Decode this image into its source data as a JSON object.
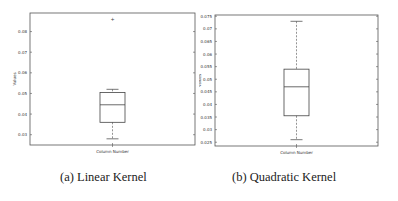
{
  "figure": {
    "captions": [
      "(a) Linear Kernel",
      "(b) Quadratic Kernel"
    ]
  },
  "chart_data": [
    {
      "type": "box",
      "title": "(a) Linear Kernel",
      "xlabel": "Column Number",
      "ylabel": "Values",
      "ylim": [
        0.025,
        0.089
      ],
      "yticks": [
        0.03,
        0.04,
        0.05,
        0.06,
        0.07,
        0.08
      ],
      "ytick_labels": [
        "0.03",
        "0.04",
        "0.05",
        "0.06",
        "0.07",
        "0.08"
      ],
      "grid": false,
      "box": {
        "whisker_low": 0.028,
        "q1": 0.036,
        "median": 0.0445,
        "q3": 0.0505,
        "whisker_high": 0.052,
        "outliers": [
          0.086
        ]
      }
    },
    {
      "type": "box",
      "title": "(b) Quadratic Kernel",
      "xlabel": "Column Number",
      "ylabel": "Values",
      "ylim": [
        0.0235,
        0.0755
      ],
      "yticks": [
        0.025,
        0.03,
        0.035,
        0.04,
        0.045,
        0.05,
        0.055,
        0.06,
        0.065,
        0.07,
        0.075
      ],
      "ytick_labels": [
        "0.025",
        "0.03",
        "0.035",
        "0.04",
        "0.045",
        "0.05",
        "0.055",
        "0.06",
        "0.065",
        "0.07",
        "0.075"
      ],
      "grid": false,
      "box": {
        "whisker_low": 0.026,
        "q1": 0.0355,
        "median": 0.047,
        "q3": 0.054,
        "whisker_high": 0.073,
        "outliers": []
      }
    }
  ]
}
